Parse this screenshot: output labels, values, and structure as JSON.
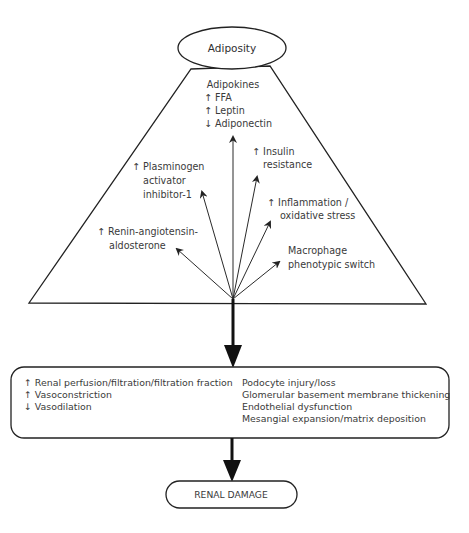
{
  "source_node": {
    "label": "Adiposity"
  },
  "factors": {
    "adipokines": {
      "heading": "Adipokines",
      "lines": [
        "↑ FFA",
        "↑ Leptin",
        "↓ Adiponectin"
      ]
    },
    "insulin": {
      "lines": [
        "↑ Insulin",
        "resistance"
      ]
    },
    "pai1": {
      "lines": [
        "↑ Plasminogen",
        "activator",
        "inhibitor-1"
      ]
    },
    "inflammation": {
      "lines": [
        "↑ Inflammation /",
        "oxidative stress"
      ]
    },
    "raas": {
      "lines": [
        "↑ Renin-angiotensin-",
        "aldosterone"
      ]
    },
    "macrophage": {
      "lines": [
        "Macrophage",
        "phenotypic switch"
      ]
    }
  },
  "mechanisms_box": {
    "hemodynamic": [
      "↑ Renal perfusion/filtration/filtration fraction",
      "↑ Vasoconstriction",
      "↓ Vasodilation"
    ],
    "structural": [
      "Podocyte injury/loss",
      "Glomerular basement membrane thickening",
      "Endothelial dysfunction",
      "Mesangial expansion/matrix deposition"
    ]
  },
  "outcome_node": {
    "label": "RENAL DAMAGE"
  },
  "colors": {
    "line": "#222222",
    "text": "#3a3a3a",
    "background": "#ffffff"
  }
}
